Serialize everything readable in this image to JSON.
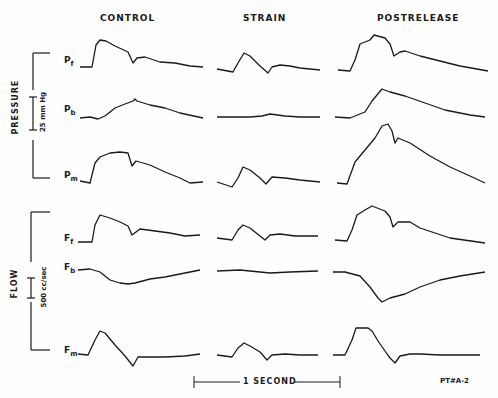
{
  "figure": {
    "columns": [
      "CONTROL",
      "STRAIN",
      "POSTRELEASE"
    ],
    "group_labels": {
      "pressure": "PRESSURE",
      "flow": "FLOW"
    },
    "scale_bars": {
      "pressure": "25 mm Hg",
      "flow": "500 cc/sec",
      "time": "1 SECOND"
    },
    "trace_labels": {
      "pf": {
        "main": "P",
        "sub": "f"
      },
      "pb": {
        "main": "P",
        "sub": "b"
      },
      "pm": {
        "main": "P",
        "sub": "m"
      },
      "ff": {
        "main": "F",
        "sub": "f"
      },
      "fb": {
        "main": "F",
        "sub": "b"
      },
      "fm": {
        "main": "F",
        "sub": "m"
      }
    },
    "id_label": "PT#A-2"
  },
  "chart_data": {
    "type": "line",
    "title": "",
    "columns": [
      "CONTROL",
      "STRAIN",
      "POSTRELEASE"
    ],
    "xlabel": "time (scale bar: 1 SECOND)",
    "groups": [
      {
        "name": "PRESSURE",
        "scale": "25 mm Hg",
        "traces": [
          "Pf",
          "Pb",
          "Pm"
        ]
      },
      {
        "name": "FLOW",
        "scale": "500 cc/sec",
        "traces": [
          "Ff",
          "Fb",
          "Fm"
        ]
      }
    ],
    "note": "Polyline points are pixel coordinates [x,y] within the 498x398 figure; waveforms are uncalibrated traces",
    "series": [
      {
        "name": "Pf",
        "column": "CONTROL",
        "points": [
          [
            80,
            67
          ],
          [
            92,
            67
          ],
          [
            96,
            45
          ],
          [
            100,
            40
          ],
          [
            106,
            41
          ],
          [
            115,
            46
          ],
          [
            128,
            52
          ],
          [
            133,
            63
          ],
          [
            137,
            58
          ],
          [
            145,
            57
          ],
          [
            160,
            62
          ],
          [
            175,
            63
          ],
          [
            190,
            66
          ],
          [
            203,
            67
          ]
        ]
      },
      {
        "name": "Pb",
        "column": "CONTROL",
        "points": [
          [
            80,
            118
          ],
          [
            90,
            117
          ],
          [
            98,
            119
          ],
          [
            105,
            116
          ],
          [
            115,
            108
          ],
          [
            125,
            104
          ],
          [
            133,
            101
          ],
          [
            135,
            99
          ],
          [
            137,
            101
          ],
          [
            150,
            105
          ],
          [
            165,
            108
          ],
          [
            180,
            113
          ],
          [
            203,
            118
          ]
        ]
      },
      {
        "name": "Pm",
        "column": "CONTROL",
        "points": [
          [
            80,
            181
          ],
          [
            90,
            183
          ],
          [
            95,
            163
          ],
          [
            100,
            157
          ],
          [
            110,
            153
          ],
          [
            120,
            152
          ],
          [
            128,
            153
          ],
          [
            132,
            166
          ],
          [
            136,
            161
          ],
          [
            150,
            165
          ],
          [
            165,
            172
          ],
          [
            180,
            178
          ],
          [
            190,
            183
          ],
          [
            203,
            182
          ]
        ]
      },
      {
        "name": "Pf",
        "column": "STRAIN",
        "points": [
          [
            217,
            69
          ],
          [
            233,
            72
          ],
          [
            238,
            63
          ],
          [
            244,
            53
          ],
          [
            250,
            56
          ],
          [
            260,
            66
          ],
          [
            268,
            73
          ],
          [
            272,
            67
          ],
          [
            280,
            65
          ],
          [
            290,
            66
          ],
          [
            300,
            68
          ],
          [
            320,
            70
          ]
        ]
      },
      {
        "name": "Pb",
        "column": "STRAIN",
        "points": [
          [
            217,
            117
          ],
          [
            235,
            117
          ],
          [
            250,
            117
          ],
          [
            262,
            116
          ],
          [
            270,
            114
          ],
          [
            285,
            116
          ],
          [
            300,
            117
          ],
          [
            320,
            117
          ]
        ]
      },
      {
        "name": "Pm",
        "column": "STRAIN",
        "points": [
          [
            217,
            182
          ],
          [
            232,
            187
          ],
          [
            238,
            178
          ],
          [
            243,
            167
          ],
          [
            250,
            170
          ],
          [
            260,
            178
          ],
          [
            266,
            184
          ],
          [
            272,
            177
          ],
          [
            285,
            178
          ],
          [
            300,
            180
          ],
          [
            320,
            182
          ]
        ]
      },
      {
        "name": "Pf",
        "column": "POSTRELEASE",
        "points": [
          [
            338,
            70
          ],
          [
            350,
            71
          ],
          [
            355,
            60
          ],
          [
            360,
            44
          ],
          [
            370,
            40
          ],
          [
            374,
            35
          ],
          [
            385,
            38
          ],
          [
            390,
            44
          ],
          [
            394,
            56
          ],
          [
            400,
            52
          ],
          [
            405,
            51
          ],
          [
            420,
            56
          ],
          [
            440,
            61
          ],
          [
            460,
            66
          ],
          [
            488,
            71
          ]
        ]
      },
      {
        "name": "Pb",
        "column": "POSTRELEASE",
        "points": [
          [
            335,
            117
          ],
          [
            350,
            118
          ],
          [
            365,
            112
          ],
          [
            372,
            101
          ],
          [
            382,
            89
          ],
          [
            390,
            92
          ],
          [
            405,
            96
          ],
          [
            425,
            103
          ],
          [
            445,
            110
          ],
          [
            470,
            115
          ],
          [
            485,
            117
          ]
        ]
      },
      {
        "name": "Pm",
        "column": "POSTRELEASE",
        "points": [
          [
            337,
            183
          ],
          [
            347,
            184
          ],
          [
            355,
            162
          ],
          [
            365,
            150
          ],
          [
            375,
            138
          ],
          [
            382,
            126
          ],
          [
            388,
            124
          ],
          [
            392,
            131
          ],
          [
            395,
            143
          ],
          [
            398,
            138
          ],
          [
            410,
            143
          ],
          [
            430,
            156
          ],
          [
            450,
            167
          ],
          [
            470,
            176
          ],
          [
            485,
            183
          ]
        ]
      },
      {
        "name": "Ff",
        "column": "CONTROL",
        "points": [
          [
            78,
            242
          ],
          [
            92,
            242
          ],
          [
            95,
            225
          ],
          [
            100,
            215
          ],
          [
            110,
            218
          ],
          [
            120,
            222
          ],
          [
            128,
            226
          ],
          [
            132,
            235
          ],
          [
            140,
            229
          ],
          [
            155,
            231
          ],
          [
            170,
            233
          ],
          [
            185,
            236
          ],
          [
            200,
            235
          ]
        ]
      },
      {
        "name": "Fb",
        "column": "CONTROL",
        "points": [
          [
            78,
            270
          ],
          [
            90,
            269
          ],
          [
            100,
            272
          ],
          [
            110,
            280
          ],
          [
            120,
            283
          ],
          [
            128,
            284
          ],
          [
            135,
            283
          ],
          [
            150,
            279
          ],
          [
            165,
            277
          ],
          [
            180,
            274
          ],
          [
            200,
            270
          ]
        ]
      },
      {
        "name": "Fm",
        "column": "CONTROL",
        "points": [
          [
            78,
            354
          ],
          [
            88,
            355
          ],
          [
            95,
            340
          ],
          [
            100,
            331
          ],
          [
            105,
            333
          ],
          [
            115,
            345
          ],
          [
            125,
            356
          ],
          [
            133,
            366
          ],
          [
            138,
            357
          ],
          [
            150,
            357
          ],
          [
            165,
            357
          ],
          [
            185,
            356
          ],
          [
            200,
            354
          ]
        ]
      },
      {
        "name": "Ff",
        "column": "STRAIN",
        "points": [
          [
            217,
            238
          ],
          [
            232,
            240
          ],
          [
            238,
            230
          ],
          [
            243,
            225
          ],
          [
            250,
            228
          ],
          [
            260,
            236
          ],
          [
            265,
            240
          ],
          [
            270,
            235
          ],
          [
            280,
            234
          ],
          [
            295,
            236
          ],
          [
            318,
            236
          ]
        ]
      },
      {
        "name": "Fb",
        "column": "STRAIN",
        "points": [
          [
            217,
            271
          ],
          [
            240,
            270
          ],
          [
            260,
            272
          ],
          [
            270,
            273
          ],
          [
            290,
            272
          ],
          [
            318,
            271
          ]
        ]
      },
      {
        "name": "Fm",
        "column": "STRAIN",
        "points": [
          [
            217,
            355
          ],
          [
            232,
            357
          ],
          [
            238,
            348
          ],
          [
            244,
            343
          ],
          [
            250,
            346
          ],
          [
            260,
            352
          ],
          [
            267,
            360
          ],
          [
            272,
            355
          ],
          [
            285,
            354
          ],
          [
            300,
            355
          ],
          [
            318,
            355
          ]
        ]
      },
      {
        "name": "Ff",
        "column": "POSTRELEASE",
        "points": [
          [
            335,
            240
          ],
          [
            347,
            241
          ],
          [
            352,
            230
          ],
          [
            357,
            215
          ],
          [
            365,
            210
          ],
          [
            372,
            206
          ],
          [
            385,
            211
          ],
          [
            390,
            217
          ],
          [
            393,
            227
          ],
          [
            398,
            222
          ],
          [
            410,
            222
          ],
          [
            420,
            228
          ],
          [
            435,
            233
          ],
          [
            450,
            238
          ],
          [
            485,
            243
          ]
        ]
      },
      {
        "name": "Fb",
        "column": "POSTRELEASE",
        "points": [
          [
            333,
            272
          ],
          [
            345,
            272
          ],
          [
            360,
            276
          ],
          [
            370,
            287
          ],
          [
            378,
            298
          ],
          [
            382,
            302
          ],
          [
            390,
            298
          ],
          [
            405,
            294
          ],
          [
            420,
            287
          ],
          [
            440,
            280
          ],
          [
            460,
            276
          ],
          [
            485,
            272
          ]
        ]
      },
      {
        "name": "Fm",
        "column": "POSTRELEASE",
        "points": [
          [
            333,
            355
          ],
          [
            345,
            355
          ],
          [
            352,
            340
          ],
          [
            356,
            328
          ],
          [
            368,
            328
          ],
          [
            372,
            331
          ],
          [
            378,
            341
          ],
          [
            385,
            351
          ],
          [
            390,
            358
          ],
          [
            395,
            363
          ],
          [
            400,
            356
          ],
          [
            410,
            354
          ],
          [
            420,
            354
          ],
          [
            440,
            355
          ],
          [
            480,
            355
          ]
        ]
      }
    ],
    "legend": "none",
    "grid": false
  }
}
